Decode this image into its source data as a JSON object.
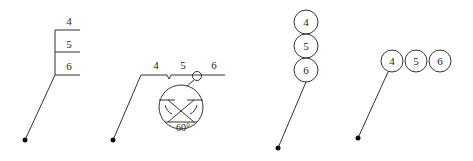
{
  "diagram": {
    "variant_a": {
      "labels": [
        "4",
        "5",
        "6"
      ],
      "style": "stacked horizontal shelves"
    },
    "variant_b": {
      "labels": [
        "4",
        "5",
        "6"
      ],
      "style": "horizontal line with weld/angle symbol",
      "angle_label": "60°"
    },
    "variant_c": {
      "labels": [
        "4",
        "5",
        "6"
      ],
      "style": "vertically stacked circles"
    },
    "variant_d": {
      "labels": [
        "4",
        "5",
        "6"
      ],
      "style": "horizontally adjacent circles"
    }
  }
}
